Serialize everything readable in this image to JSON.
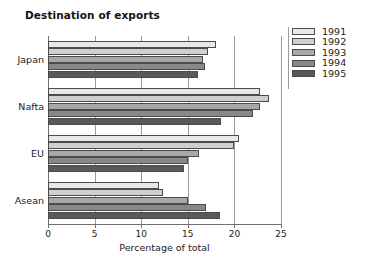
{
  "chart_data": {
    "type": "bar",
    "orientation": "horizontal",
    "title": "Destination of exports",
    "xlabel": "Percentage of total",
    "ylabel": "",
    "categories": [
      "Japan",
      "Nafta",
      "EU",
      "Asean"
    ],
    "series": [
      {
        "name": "1991",
        "color": "#e8e8e8",
        "values": [
          18.0,
          22.8,
          20.5,
          11.9
        ]
      },
      {
        "name": "1992",
        "color": "#cfcfcf",
        "values": [
          17.2,
          23.7,
          20.0,
          12.3
        ]
      },
      {
        "name": "1993",
        "color": "#a8a8a8",
        "values": [
          16.6,
          22.7,
          16.2,
          15.0
        ]
      },
      {
        "name": "1994",
        "color": "#888888",
        "values": [
          16.8,
          22.0,
          15.0,
          17.0
        ]
      },
      {
        "name": "1995",
        "color": "#595959",
        "values": [
          16.1,
          18.6,
          14.6,
          18.5
        ]
      }
    ],
    "xlim": [
      0,
      25
    ],
    "xticks": [
      0,
      5,
      10,
      15,
      20,
      25
    ],
    "xtick_labels": [
      "0",
      "5",
      "10",
      "15",
      "20",
      "25"
    ],
    "grid": "vertical",
    "legend_position": "right",
    "legend_entries": [
      "1991",
      "1992",
      "1993",
      "1994",
      "1995"
    ]
  }
}
